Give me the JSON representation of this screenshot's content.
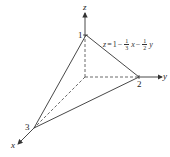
{
  "figure": {
    "axes": {
      "x_label": "x",
      "y_label": "y",
      "z_label": "z"
    },
    "intercepts": {
      "x": "3",
      "y": "2",
      "z": "1"
    },
    "equation": {
      "lhs": "z",
      "eq": "=",
      "const": "1",
      "minus1": "−",
      "frac1_num": "1",
      "frac1_den": "3",
      "var1": "x",
      "minus2": "−",
      "frac2_num": "1",
      "frac2_den": "2",
      "var2": "y"
    },
    "colors": {
      "line": "#333333"
    }
  }
}
